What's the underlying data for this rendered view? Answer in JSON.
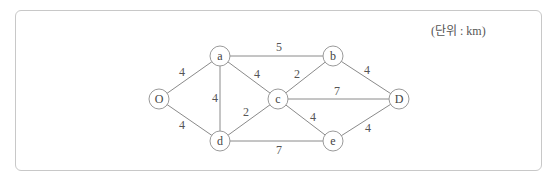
{
  "diagram": {
    "type": "weighted-undirected-graph",
    "unit_label": "(단위 : km)",
    "colors": {
      "edge": "#8a8a8a",
      "node_border": "#9a9a9a",
      "frame_border": "#c8c8c8",
      "text": "#444444"
    },
    "nodes": [
      {
        "id": "O",
        "label": "O",
        "x": 159,
        "y": 99
      },
      {
        "id": "a",
        "label": "a",
        "x": 220,
        "y": 56
      },
      {
        "id": "b",
        "label": "b",
        "x": 333,
        "y": 56
      },
      {
        "id": "c",
        "label": "c",
        "x": 278,
        "y": 99
      },
      {
        "id": "D",
        "label": "D",
        "x": 399,
        "y": 99
      },
      {
        "id": "d",
        "label": "d",
        "x": 220,
        "y": 141
      },
      {
        "id": "e",
        "label": "e",
        "x": 333,
        "y": 141
      }
    ],
    "edges": [
      {
        "from": "O",
        "to": "a",
        "weight": "4",
        "lx": 182,
        "ly": 72
      },
      {
        "from": "O",
        "to": "d",
        "weight": "4",
        "lx": 182,
        "ly": 125
      },
      {
        "from": "a",
        "to": "d",
        "weight": "4",
        "lx": 215,
        "ly": 98
      },
      {
        "from": "a",
        "to": "b",
        "weight": "5",
        "lx": 279,
        "ly": 47
      },
      {
        "from": "a",
        "to": "c",
        "weight": "4",
        "lx": 257,
        "ly": 74
      },
      {
        "from": "d",
        "to": "c",
        "weight": "2",
        "lx": 246,
        "ly": 112
      },
      {
        "from": "d",
        "to": "e",
        "weight": "7",
        "lx": 279,
        "ly": 150
      },
      {
        "from": "c",
        "to": "b",
        "weight": "2",
        "lx": 297,
        "ly": 74
      },
      {
        "from": "c",
        "to": "D",
        "weight": "7",
        "lx": 337,
        "ly": 91
      },
      {
        "from": "c",
        "to": "e",
        "weight": "4",
        "lx": 313,
        "ly": 117
      },
      {
        "from": "b",
        "to": "D",
        "weight": "4",
        "lx": 367,
        "ly": 70
      },
      {
        "from": "e",
        "to": "D",
        "weight": "4",
        "lx": 368,
        "ly": 128
      }
    ]
  }
}
